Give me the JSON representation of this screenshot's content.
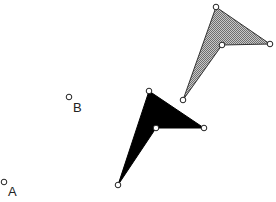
{
  "diagram": {
    "points": [
      {
        "name": "A",
        "label": "A"
      },
      {
        "name": "B",
        "label": "B"
      }
    ],
    "shapes": [
      {
        "name": "original",
        "fill": "hatched-gray",
        "color": "#8a8a8a"
      },
      {
        "name": "image",
        "fill": "solid-black",
        "color": "#000000"
      }
    ]
  }
}
